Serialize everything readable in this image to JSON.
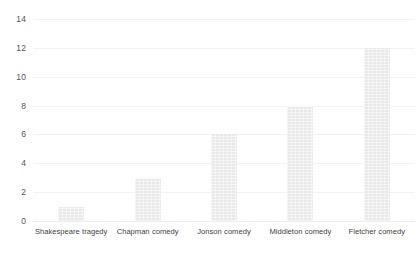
{
  "chart_data": {
    "type": "bar",
    "title": "",
    "subtitle": "",
    "xlabel": "",
    "ylabel": "",
    "categories": [
      "Shakespeare tragedy",
      "Chapman comedy",
      "Jonson comedy",
      "Middleton comedy",
      "Fletcher comedy"
    ],
    "values": [
      1,
      3,
      6,
      8,
      12
    ],
    "ylim": [
      0,
      14
    ],
    "ytick_labels": [
      "14",
      "12",
      "10",
      "8",
      "6",
      "4",
      "2",
      "0"
    ],
    "ytick_values": [
      14,
      12,
      10,
      8,
      6,
      4,
      2,
      0
    ],
    "ytick_step": 2,
    "grid": true,
    "grid_axis": "y",
    "legend": false,
    "legend_position": "none",
    "colors": {
      "bar_fill": "#e9e9e9",
      "gridline": "#f2f2f2",
      "baseline": "#ededed",
      "y_tick_text": "#555555",
      "x_tick_text": "#3f3f3f",
      "background": "#ffffff"
    }
  }
}
